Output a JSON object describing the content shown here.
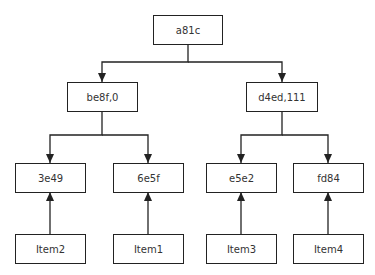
{
  "diagram": {
    "type": "tree",
    "colors": {
      "stroke": "#222222",
      "text": "#333333",
      "background": "#ffffff"
    },
    "nodes": {
      "root": {
        "label": "a81c"
      },
      "left": {
        "label": "be8f,0"
      },
      "right": {
        "label": "d4ed,111"
      },
      "ll": {
        "label": "3e49"
      },
      "lr": {
        "label": "6e5f"
      },
      "rl": {
        "label": "e5e2"
      },
      "rr": {
        "label": "fd84"
      },
      "item2": {
        "label": "Item2"
      },
      "item1": {
        "label": "Item1"
      },
      "item3": {
        "label": "Item3"
      },
      "item4": {
        "label": "Item4"
      }
    },
    "edges": [
      {
        "from": "a81c",
        "to": "be8f,0"
      },
      {
        "from": "a81c",
        "to": "d4ed,111"
      },
      {
        "from": "be8f,0",
        "to": "3e49"
      },
      {
        "from": "be8f,0",
        "to": "6e5f"
      },
      {
        "from": "d4ed,111",
        "to": "e5e2"
      },
      {
        "from": "d4ed,111",
        "to": "fd84"
      },
      {
        "from": "Item2",
        "to": "3e49"
      },
      {
        "from": "Item1",
        "to": "6e5f"
      },
      {
        "from": "Item3",
        "to": "e5e2"
      },
      {
        "from": "Item4",
        "to": "fd84"
      }
    ]
  }
}
